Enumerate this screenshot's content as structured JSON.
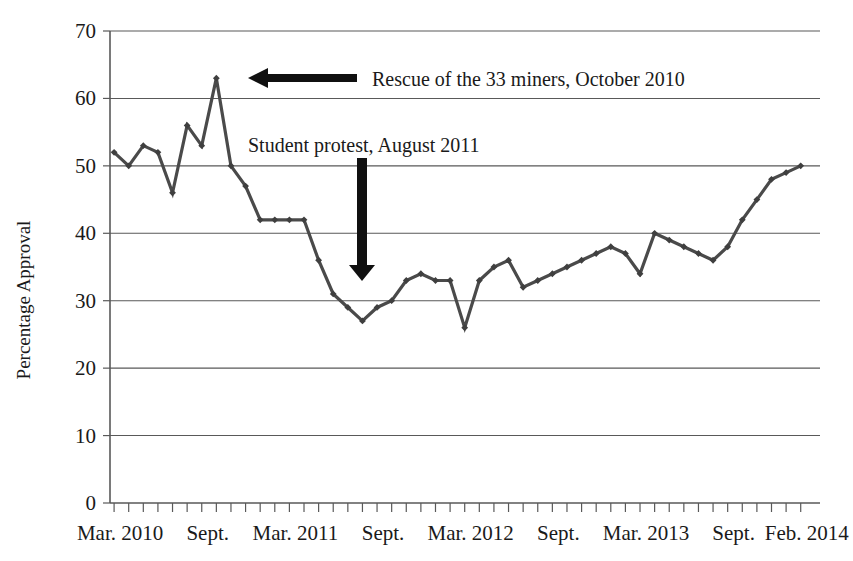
{
  "chart_data": {
    "type": "line",
    "title": "",
    "xlabel": "",
    "ylabel": "Percentage Approval",
    "ylim": [
      0,
      70
    ],
    "ytick_values": [
      0,
      10,
      20,
      30,
      40,
      50,
      60,
      70
    ],
    "ytick_labels": [
      "0",
      "10",
      "20",
      "30",
      "40",
      "50",
      "60",
      "70"
    ],
    "grid": "horizontal",
    "legend": "none",
    "xtick_labels": [
      "Mar. 2010",
      "Sept.",
      "Mar. 2011",
      "Sept.",
      "Mar. 2012",
      "Sept.",
      "Mar. 2013",
      "Sept.",
      "Feb. 2014"
    ],
    "xtick_indices": [
      0,
      6,
      12,
      18,
      24,
      30,
      36,
      42,
      47
    ],
    "x": [
      "Mar. 2010",
      "Apr. 2010",
      "May 2010",
      "Jun. 2010",
      "Jul. 2010",
      "Aug. 2010",
      "Sept. 2010",
      "Oct. 2010",
      "Nov. 2010",
      "Dec. 2010",
      "Jan. 2011",
      "Feb. 2011",
      "Mar. 2011",
      "Apr. 2011",
      "May 2011",
      "Jun. 2011",
      "Jul. 2011",
      "Aug. 2011",
      "Sept. 2011",
      "Oct. 2011",
      "Nov. 2011",
      "Dec. 2011",
      "Jan. 2012",
      "Feb. 2012",
      "Mar. 2012",
      "Apr. 2012",
      "May 2012",
      "Jun. 2012",
      "Jul. 2012",
      "Aug. 2012",
      "Sept. 2012",
      "Oct. 2012",
      "Nov. 2012",
      "Dec. 2012",
      "Jan. 2013",
      "Feb. 2013",
      "Mar. 2013",
      "Apr. 2013",
      "May 2013",
      "Jun. 2013",
      "Jul. 2013",
      "Aug. 2013",
      "Sept. 2013",
      "Oct. 2013",
      "Nov. 2013",
      "Dec. 2013",
      "Jan. 2014",
      "Feb. 2014"
    ],
    "values": [
      52,
      50,
      53,
      52,
      46,
      56,
      53,
      63,
      50,
      47,
      42,
      42,
      42,
      42,
      36,
      31,
      29,
      27,
      29,
      30,
      33,
      34,
      33,
      33,
      26,
      33,
      35,
      36,
      32,
      33,
      34,
      35,
      36,
      37,
      38,
      37,
      34,
      40,
      39,
      38,
      37,
      36,
      38,
      42,
      45,
      48,
      49,
      50
    ],
    "annotations": [
      {
        "name": "rescue-of-miners",
        "text": "Rescue of the 33 miners, October 2010",
        "arrow": "left",
        "points_to": "Oct. 2010"
      },
      {
        "name": "student-protest",
        "text": "Student protest, August 2011",
        "arrow": "down",
        "points_to": "Aug. 2011"
      }
    ],
    "colors": {
      "line": "#4a4a4a",
      "marker": "#3f3f3f",
      "grid": "#595959",
      "axis": "#595959",
      "annotation": "#101010",
      "text": "#1a1a1a",
      "background": "#ffffff"
    }
  }
}
